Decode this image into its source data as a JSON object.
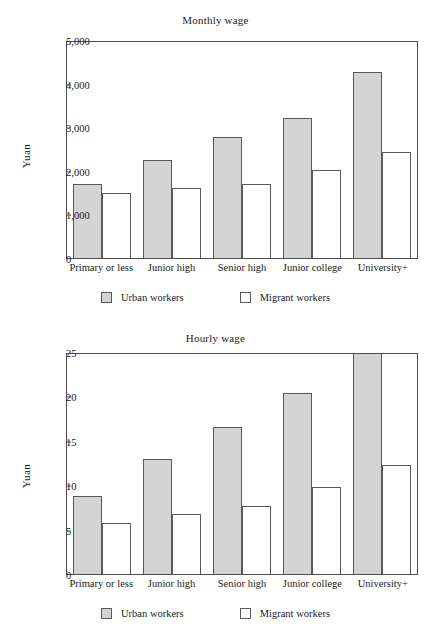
{
  "figure": {
    "categories": [
      "Primary or less",
      "Junior high",
      "Senior high",
      "Junior college",
      "University+"
    ],
    "legend": [
      {
        "label": "Urban workers",
        "color": "#d4d4d4",
        "key": "urban"
      },
      {
        "label": "Migrant workers",
        "color": "#ffffff",
        "key": "migrant"
      }
    ]
  },
  "chart_data": [
    {
      "type": "bar",
      "title": "Monthly wage",
      "xlabel": "",
      "ylabel": "Yuan",
      "ylim": [
        0,
        5000
      ],
      "yticks": [
        0,
        1000,
        2000,
        3000,
        4000,
        5000
      ],
      "ytick_labels": [
        "0",
        "1,000",
        "2,000",
        "3,000",
        "4,000",
        "5,000"
      ],
      "grid": false,
      "legend_position": "bottom",
      "categories": [
        "Primary or less",
        "Junior high",
        "Senior high",
        "Junior college",
        "University+"
      ],
      "series": [
        {
          "name": "Urban workers",
          "values": [
            1700,
            2250,
            2770,
            3220,
            4270
          ]
        },
        {
          "name": "Migrant workers",
          "values": [
            1490,
            1610,
            1700,
            2020,
            2440
          ]
        }
      ]
    },
    {
      "type": "bar",
      "title": "Hourly wage",
      "xlabel": "",
      "ylabel": "Yuan",
      "ylim": [
        0,
        25
      ],
      "yticks": [
        0,
        5,
        10,
        15,
        20,
        25
      ],
      "ytick_labels": [
        "0",
        "5",
        "10",
        "15",
        "20",
        "25"
      ],
      "grid": false,
      "legend_position": "bottom",
      "categories": [
        "Primary or less",
        "Junior high",
        "Senior high",
        "Junior college",
        "University+"
      ],
      "series": [
        {
          "name": "Urban workers",
          "values": [
            8.8,
            12.9,
            16.5,
            20.4,
            26.5
          ]
        },
        {
          "name": "Migrant workers",
          "values": [
            5.8,
            6.8,
            7.7,
            9.8,
            12.3
          ]
        }
      ]
    }
  ]
}
